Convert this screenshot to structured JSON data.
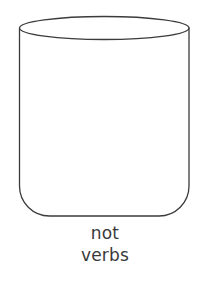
{
  "figure": {
    "kind": "line-drawing",
    "background_color": "#ffffff",
    "stroke_color": "#3b3b3b",
    "stroke_width": 1.3,
    "fill_color": "#ffffff",
    "geometry": {
      "body_left_x": 19.5,
      "body_right_x": 189,
      "body_top_y": 28,
      "body_bottom_y": 216,
      "corner_radius": 30,
      "ellipse_center_x": 104.25,
      "ellipse_center_y": 28,
      "ellipse_rx": 84.75,
      "ellipse_ry": 11.5
    }
  },
  "caption": {
    "color": "#3a3a3a",
    "font_size": 17,
    "align": "center",
    "lines": [
      {
        "text": "not",
        "x": 105,
        "y": 239
      },
      {
        "text": "verbs",
        "x": 105,
        "y": 261
      }
    ]
  }
}
